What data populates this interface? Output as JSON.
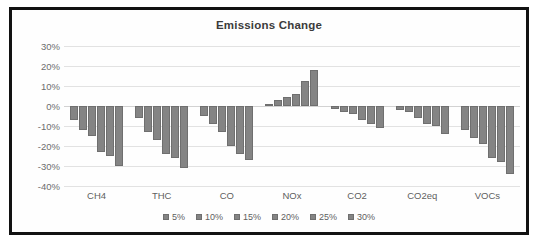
{
  "chart_data": {
    "type": "bar",
    "title": "Emissions Change",
    "xlabel": "",
    "ylabel": "",
    "ylim": [
      -40,
      30
    ],
    "yticks": [
      30,
      20,
      10,
      0,
      -10,
      -20,
      -30,
      -40
    ],
    "ytick_labels": [
      "30%",
      "20%",
      "10%",
      "0%",
      "-10%",
      "-20%",
      "-30%",
      "-40%"
    ],
    "grid": true,
    "legend_position": "bottom",
    "orientation": "vertical",
    "bar_color": "#848484",
    "categories": [
      "CH4",
      "THC",
      "CO",
      "NOx",
      "CO2",
      "CO2eq",
      "VOCs"
    ],
    "series": [
      {
        "name": "5%",
        "values": [
          -7,
          -6,
          -5,
          1,
          -1.5,
          -2,
          -12
        ]
      },
      {
        "name": "10%",
        "values": [
          -12,
          -13,
          -9,
          3,
          -3,
          -3,
          -16
        ]
      },
      {
        "name": "15%",
        "values": [
          -15,
          -17,
          -13,
          4.5,
          -4,
          -6,
          -19
        ]
      },
      {
        "name": "20%",
        "values": [
          -23,
          -24,
          -20,
          6,
          -7,
          -9,
          -26
        ]
      },
      {
        "name": "25%",
        "values": [
          -25,
          -26,
          -24,
          12.5,
          -9,
          -10,
          -28
        ]
      },
      {
        "name": "30%",
        "values": [
          -30,
          -31,
          -27,
          18,
          -11,
          -14,
          -34
        ]
      }
    ]
  },
  "legend": {
    "entries": [
      "5%",
      "10%",
      "15%",
      "20%",
      "25%",
      "30%"
    ]
  }
}
